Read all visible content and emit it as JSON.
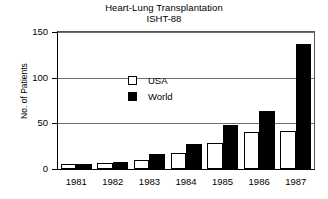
{
  "chart_data": {
    "type": "bar",
    "title": "Heart-Lung Transplantation",
    "subtitle": "ISHT-88",
    "xlabel": "",
    "ylabel": "No. of Patients",
    "categories": [
      "1981",
      "1982",
      "1983",
      "1984",
      "1985",
      "1986",
      "1987"
    ],
    "series": [
      {
        "name": "USA",
        "values": [
          5,
          7,
          10,
          18,
          28,
          40,
          42
        ],
        "color": "#ffffff"
      },
      {
        "name": "World",
        "values": [
          5,
          8,
          16,
          27,
          48,
          63,
          137
        ],
        "color": "#000000"
      }
    ],
    "ylim": [
      0,
      150
    ],
    "yticks": [
      0,
      50,
      100,
      150
    ],
    "ytick_labels": [
      "0",
      "50",
      "100",
      "150"
    ],
    "grid": true,
    "legend_position": "top-left",
    "legend_entries": [
      "USA",
      "World"
    ]
  }
}
